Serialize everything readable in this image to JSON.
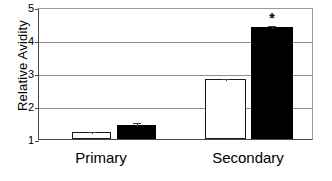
{
  "chart_data": {
    "type": "bar",
    "title": "",
    "xlabel": "",
    "ylabel": "Relative Avidity",
    "categories": [
      "Primary",
      "Secondary"
    ],
    "ylim": [
      1,
      5
    ],
    "yticks": [
      1,
      2,
      3,
      4,
      5
    ],
    "ytick_labels": [
      "1",
      "2",
      "3",
      "4",
      "5"
    ],
    "grid": "horizontal",
    "legend": "none",
    "baseline": 1,
    "series": [
      {
        "name": "open-bar",
        "style": "open",
        "values": [
          1.22,
          2.81
        ],
        "errors": [
          0.06,
          0.07
        ]
      },
      {
        "name": "filled-bar",
        "style": "filled",
        "values": [
          1.42,
          4.38
        ],
        "errors": [
          0.14,
          0.1
        ]
      }
    ],
    "annotations": [
      {
        "text": "*",
        "category": "Secondary",
        "series": "filled-bar",
        "value": 4.38
      }
    ]
  },
  "axis": {
    "y_title": "Relative Avidity",
    "tick_5": "5",
    "tick_4": "4",
    "tick_3": "3",
    "tick_2": "2",
    "tick_1": "1"
  },
  "categories": {
    "primary": "Primary",
    "secondary": "Secondary"
  },
  "marks": {
    "asterisk": "*"
  },
  "colors": {
    "open_fill": "#ffffff",
    "filled_fill": "#000000",
    "axis": "#4a4a4a",
    "grid": "#8d8d8d"
  }
}
